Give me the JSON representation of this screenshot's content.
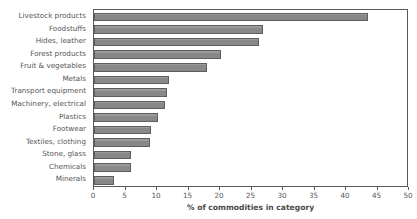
{
  "chart_data": {
    "type": "bar",
    "orientation": "horizontal",
    "title": "",
    "xlabel": "% of commodities in category",
    "ylabel": "",
    "xlim": [
      0,
      50
    ],
    "xticks": [
      0,
      5,
      10,
      15,
      20,
      25,
      30,
      35,
      40,
      45,
      50
    ],
    "grid": false,
    "legend": null,
    "bar_color": "#888888",
    "bar_edge_color": "#5e5e5e",
    "categories": [
      "Livestock products",
      "Foodstuffs",
      "Hides, leather",
      "Forest products",
      "Fruit & vegetables",
      "Metals",
      "Transport equipment",
      "Machinery, electrical",
      "Plastics",
      "Footwear",
      "Textiles, clothing",
      "Stone, glass",
      "Chemicals",
      "Minerals"
    ],
    "values": [
      43.5,
      26.8,
      26.2,
      20.1,
      17.9,
      11.9,
      11.6,
      11.3,
      10.2,
      9.1,
      8.9,
      5.9,
      5.8,
      3.2
    ]
  }
}
